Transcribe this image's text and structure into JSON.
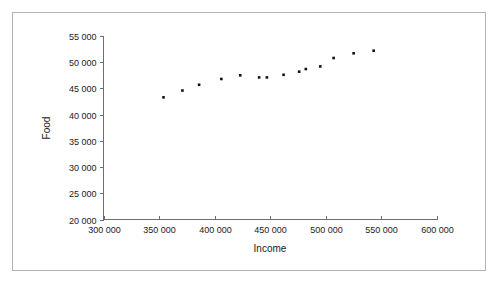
{
  "figure": {
    "background_color": "#ffffff",
    "frame_color": "#b3b3b3",
    "axis_color": "#6e6e6e",
    "marker_color": "#111111"
  },
  "chart_data": {
    "type": "scatter",
    "title": "",
    "xlabel": "Income",
    "ylabel": "Food",
    "xlim": [
      300000,
      600000
    ],
    "ylim": [
      20000,
      55000
    ],
    "xticks": [
      300000,
      350000,
      400000,
      450000,
      500000,
      550000,
      600000
    ],
    "yticks": [
      20000,
      25000,
      30000,
      35000,
      40000,
      45000,
      50000,
      55000
    ],
    "xtick_labels": [
      "300 000",
      "350 000",
      "400 000",
      "450 000",
      "500 000",
      "550 000",
      "600 000"
    ],
    "ytick_labels": [
      "20 000",
      "25 000",
      "30 000",
      "35 000",
      "40 000",
      "45 000",
      "50 000",
      "55 000"
    ],
    "grid": false,
    "legend": false,
    "series": [
      {
        "name": "Food vs Income",
        "marker": "square",
        "points": [
          {
            "x": 354000,
            "y": 43300
          },
          {
            "x": 371000,
            "y": 44600
          },
          {
            "x": 386000,
            "y": 45700
          },
          {
            "x": 406000,
            "y": 46800
          },
          {
            "x": 423000,
            "y": 47500
          },
          {
            "x": 440000,
            "y": 47100
          },
          {
            "x": 447000,
            "y": 47100
          },
          {
            "x": 462000,
            "y": 47600
          },
          {
            "x": 476000,
            "y": 48200
          },
          {
            "x": 482000,
            "y": 48700
          },
          {
            "x": 495000,
            "y": 49200
          },
          {
            "x": 507000,
            "y": 50800
          },
          {
            "x": 525000,
            "y": 51700
          },
          {
            "x": 543000,
            "y": 52200
          }
        ]
      }
    ]
  }
}
